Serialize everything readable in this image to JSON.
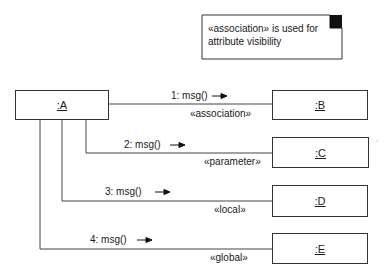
{
  "note": {
    "line1": "«association» is used for",
    "line2": "attribute visibility"
  },
  "objects": [
    {
      "id": "A",
      "label": ":A"
    },
    {
      "id": "B",
      "label": ":B"
    },
    {
      "id": "C",
      "label": ":C"
    },
    {
      "id": "D",
      "label": ":D"
    },
    {
      "id": "E",
      "label": ":E"
    }
  ],
  "links": [
    {
      "message": "1: msg()",
      "stereotype": "«association»",
      "target": "B"
    },
    {
      "message": "2: msg()",
      "stereotype": "«parameter»",
      "target": "C"
    },
    {
      "message": "3: msg()",
      "stereotype": "«local»",
      "target": "D"
    },
    {
      "message": "4: msg()",
      "stereotype": "«global»",
      "target": "E"
    }
  ]
}
